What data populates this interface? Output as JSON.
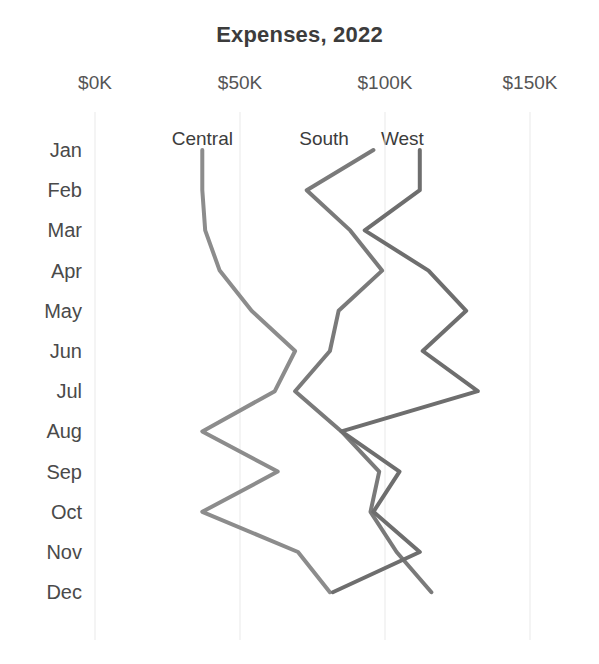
{
  "chart_data": {
    "type": "line",
    "title": "Expenses, 2022",
    "orientation": "horizontal-value-axis-top",
    "xlabel": "",
    "ylabel": "",
    "xlim": [
      0,
      165
    ],
    "value_unit": "$K",
    "grid": true,
    "legend_position": "inline-labels-top",
    "x_ticks": [
      {
        "label": "$0K",
        "value": 0
      },
      {
        "label": "$50K",
        "value": 50
      },
      {
        "label": "$100K",
        "value": 100
      },
      {
        "label": "$150K",
        "value": 150
      }
    ],
    "categories": [
      "Jan",
      "Feb",
      "Mar",
      "Apr",
      "May",
      "Jun",
      "Jul",
      "Aug",
      "Sep",
      "Oct",
      "Nov",
      "Dec"
    ],
    "series": [
      {
        "name": "Central",
        "color": "#8c8c8c",
        "values": [
          37,
          37,
          38,
          43,
          54,
          69,
          62,
          37,
          63,
          37,
          70,
          81
        ]
      },
      {
        "name": "South",
        "color": "#7a7a7a",
        "values": [
          96,
          73,
          88,
          99,
          84,
          81,
          69,
          85,
          98,
          95,
          104,
          116
        ]
      },
      {
        "name": "West",
        "color": "#6e6e6e",
        "values": [
          112,
          112,
          93,
          115,
          128,
          113,
          132,
          85,
          105,
          96,
          112,
          82
        ]
      }
    ],
    "series_label_anchors": [
      {
        "name": "Central",
        "value": 37
      },
      {
        "name": "South",
        "value": 79
      },
      {
        "name": "West",
        "value": 106
      }
    ]
  },
  "colors": {
    "background": "#ffffff",
    "title": "#3c3c3c",
    "tick_text": "#555555",
    "gridline": "#e9e9e9",
    "line_default": "#8c8c8c"
  }
}
